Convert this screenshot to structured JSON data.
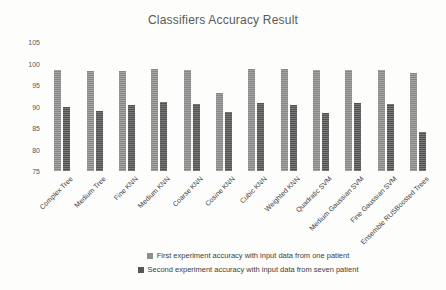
{
  "title": "Classifiers Accuracy Result",
  "chart_data": {
    "type": "bar",
    "title": "Classifiers Accuracy Result",
    "categories": [
      "Complex Tree",
      "Medium Tree",
      "Fine KNN",
      "Medium KNN",
      "Coarse KNN",
      "Cosine KNN",
      "Cubic KNN",
      "Weighted KNN",
      "Quadratic SVM",
      "Medium Gaussian SVM",
      "Fine Gaussian SVM",
      "Ensemble RUSBoosted Trees"
    ],
    "series": [
      {
        "name": "First experiment accuracy with input data from one patient",
        "color": "#8e8e8e",
        "values": [
          98.4,
          98.2,
          98.3,
          98.8,
          98.4,
          93.2,
          98.8,
          98.7,
          98.4,
          98.4,
          98.6,
          97.9
        ]
      },
      {
        "name": "Second experiment accuracy with input data from seven patient",
        "color": "#575757",
        "values": [
          90.0,
          89.0,
          90.4,
          91.0,
          90.7,
          88.8,
          90.8,
          90.3,
          88.4,
          90.8,
          90.5,
          84.0
        ]
      }
    ],
    "xlabel": "",
    "ylabel": "",
    "ylim": [
      75,
      105
    ],
    "yticks": [
      105,
      100,
      95,
      90,
      85,
      80,
      75
    ],
    "grid": false,
    "legend_position": "bottom"
  }
}
